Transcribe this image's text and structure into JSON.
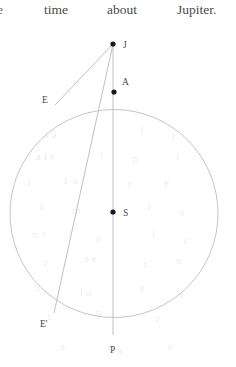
{
  "page": {
    "background_color": "#ffffff",
    "ink_color": "#4a4a4a",
    "line_color": "#b9b9b9",
    "point_color": "#1a1a1a"
  },
  "text_line": {
    "words": [
      {
        "text": "e",
        "x": -3,
        "clipped": true
      },
      {
        "text": "time",
        "x": 44
      },
      {
        "text": "about",
        "x": 107
      },
      {
        "text": "Jupiter.",
        "x": 177
      }
    ]
  },
  "figure": {
    "type": "geometry-diagram",
    "caption": "Circle with centre S, apse line J-A-S-P and sightlines from J to E and E'",
    "circle": {
      "label": "orbit-circle",
      "cx": 114,
      "cy": 213.5,
      "r": 104,
      "stroke": "#bdbdbd",
      "stroke_width": 0.9
    },
    "points": [
      {
        "id": "J",
        "label": "J",
        "x": 113,
        "y": 44,
        "lx": 123,
        "ly": 48,
        "dot": true
      },
      {
        "id": "A",
        "label": "A",
        "x": 114,
        "y": 92,
        "lx": 122,
        "ly": 85,
        "dot": true
      },
      {
        "id": "E",
        "label": "E",
        "x": 55,
        "y": 105,
        "lx": 42,
        "ly": 103,
        "dot": false
      },
      {
        "id": "S",
        "label": "S",
        "x": 113,
        "y": 212,
        "lx": 123,
        "ly": 216,
        "dot": true
      },
      {
        "id": "Ep",
        "label": "E'",
        "x": 54,
        "y": 313,
        "lx": 40,
        "ly": 327,
        "dot": false
      },
      {
        "id": "P",
        "label": "P",
        "x": 113,
        "y": 335,
        "lx": 110,
        "ly": 353,
        "dot": false
      }
    ],
    "segments": [
      {
        "id": "J-P",
        "from": "J",
        "to": "P",
        "label": "apse-line"
      },
      {
        "id": "J-E",
        "from": "J",
        "to": "E",
        "label": "sightline-to-E"
      },
      {
        "id": "J-Ep",
        "from": "J",
        "to": "Ep",
        "label": "sightline-to-E-prime"
      }
    ],
    "label_font_size": 9.5
  },
  "ghost_text": {
    "note": "faint show-through from the reverse side of the scanned leaf",
    "words": [
      {
        "text": "a a",
        "x": 44,
        "y": 128,
        "size": 11
      },
      {
        "text": "i",
        "x": 92,
        "y": 126,
        "size": 11
      },
      {
        "text": "I",
        "x": 140,
        "y": 124,
        "size": 11
      },
      {
        "text": "r",
        "x": 172,
        "y": 130,
        "size": 11
      },
      {
        "text": "a I s",
        "x": 36,
        "y": 150,
        "size": 11
      },
      {
        "text": "l",
        "x": 100,
        "y": 148,
        "size": 11
      },
      {
        "text": "n",
        "x": 132,
        "y": 152,
        "size": 11
      },
      {
        "text": "i",
        "x": 176,
        "y": 150,
        "size": 11
      },
      {
        "text": "t",
        "x": 28,
        "y": 176,
        "size": 11
      },
      {
        "text": "l  u",
        "x": 64,
        "y": 174,
        "size": 11
      },
      {
        "text": "r",
        "x": 128,
        "y": 178,
        "size": 11
      },
      {
        "text": "e",
        "x": 164,
        "y": 176,
        "size": 11
      },
      {
        "text": "l",
        "x": 40,
        "y": 200,
        "size": 11
      },
      {
        "text": "m",
        "x": 72,
        "y": 204,
        "size": 11
      },
      {
        "text": "i",
        "x": 148,
        "y": 200,
        "size": 11
      },
      {
        "text": "s",
        "x": 180,
        "y": 206,
        "size": 11
      },
      {
        "text": "n  t",
        "x": 32,
        "y": 228,
        "size": 11
      },
      {
        "text": "o",
        "x": 96,
        "y": 232,
        "size": 11
      },
      {
        "text": "i",
        "x": 152,
        "y": 228,
        "size": 11
      },
      {
        "text": "c",
        "x": 184,
        "y": 234,
        "size": 11
      },
      {
        "text": "r",
        "x": 44,
        "y": 256,
        "size": 11
      },
      {
        "text": "a e",
        "x": 84,
        "y": 252,
        "size": 11
      },
      {
        "text": "t",
        "x": 144,
        "y": 258,
        "size": 11
      },
      {
        "text": "n",
        "x": 176,
        "y": 254,
        "size": 11
      },
      {
        "text": "s",
        "x": 36,
        "y": 282,
        "size": 11
      },
      {
        "text": "l o",
        "x": 80,
        "y": 286,
        "size": 11
      },
      {
        "text": "e",
        "x": 140,
        "y": 282,
        "size": 11
      },
      {
        "text": "i",
        "x": 180,
        "y": 288,
        "size": 11
      },
      {
        "text": "t",
        "x": 48,
        "y": 310,
        "size": 11
      },
      {
        "text": "n",
        "x": 96,
        "y": 306,
        "size": 11
      },
      {
        "text": "r",
        "x": 156,
        "y": 312,
        "size": 11
      },
      {
        "text": "a",
        "x": 60,
        "y": 340,
        "size": 11
      },
      {
        "text": "i s",
        "x": 112,
        "y": 344,
        "size": 11
      },
      {
        "text": "e",
        "x": 168,
        "y": 340,
        "size": 11
      }
    ]
  }
}
